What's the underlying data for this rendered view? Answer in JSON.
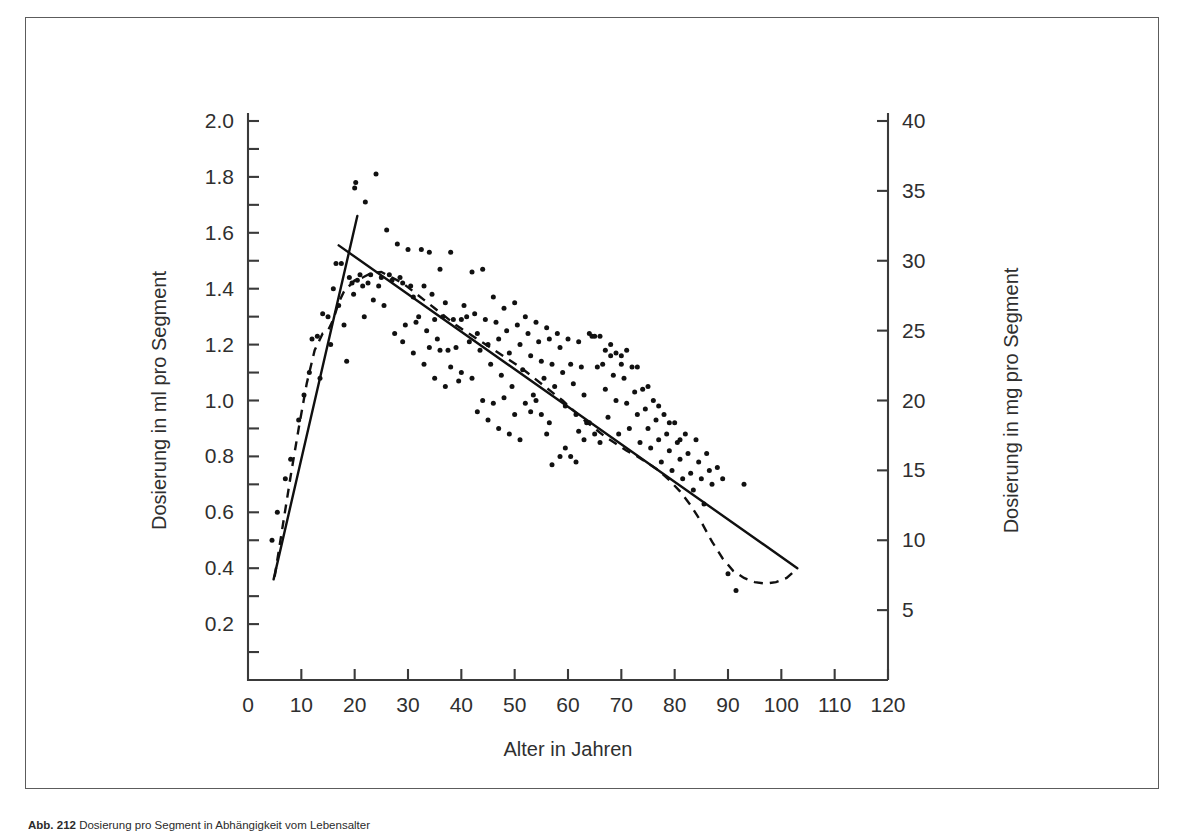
{
  "figure": {
    "caption_label": "Abb. 212",
    "caption_text": "Dosierung pro Segment in Abhängigkeit vom Lebensalter"
  },
  "chart_data": {
    "type": "scatter",
    "title": "",
    "xlabel": "Alter in Jahren",
    "ylabel": "Dosierung in ml pro Segment",
    "ylabel_right": "Dosierung in mg pro Segment",
    "xlim": [
      0,
      120
    ],
    "ylim": [
      0,
      2.0
    ],
    "ylim_right": [
      0,
      40
    ],
    "grid": false,
    "legend": "none",
    "xticks": [
      0,
      10,
      20,
      30,
      40,
      50,
      60,
      70,
      80,
      90,
      100,
      110,
      120
    ],
    "xtick_labels": [
      "0",
      "10",
      "20",
      "30",
      "40",
      "50",
      "60",
      "70",
      "80",
      "90",
      "100",
      "110",
      "120"
    ],
    "yticks": [
      0.2,
      0.4,
      0.6,
      0.8,
      1.0,
      1.2,
      1.4,
      1.6,
      1.8,
      2.0
    ],
    "ytick_labels": [
      "0.2",
      "0.4",
      "0.6",
      "0.8",
      "1.0",
      "1.2",
      "1.4",
      "1.6",
      "1.8",
      "2.0"
    ],
    "yticks_minor": [
      0.1,
      0.3,
      0.5,
      0.7,
      0.9,
      1.1,
      1.3,
      1.5,
      1.7,
      1.9
    ],
    "yticks_right": [
      5,
      10,
      15,
      20,
      25,
      30,
      35,
      40
    ],
    "ytick_labels_right": [
      "5",
      "10",
      "15",
      "20",
      "25",
      "30",
      "35",
      "40"
    ],
    "axis_color": "#3a3a3a",
    "point_color": "#111111",
    "line_color": "#101010",
    "series": [
      {
        "name": "Messpunkte",
        "marker": "dot",
        "points": [
          [
            4.5,
            0.5
          ],
          [
            5.5,
            0.6
          ],
          [
            7.0,
            0.72
          ],
          [
            8.0,
            0.79
          ],
          [
            9.5,
            0.93
          ],
          [
            10.5,
            1.02
          ],
          [
            11.5,
            1.1
          ],
          [
            12.0,
            1.22
          ],
          [
            13.0,
            1.23
          ],
          [
            13.5,
            1.08
          ],
          [
            14.0,
            1.31
          ],
          [
            15.0,
            1.3
          ],
          [
            15.5,
            1.2
          ],
          [
            16.0,
            1.4
          ],
          [
            16.5,
            1.49
          ],
          [
            17.0,
            1.34
          ],
          [
            17.5,
            1.49
          ],
          [
            18.0,
            1.27
          ],
          [
            18.5,
            1.14
          ],
          [
            19.0,
            1.44
          ],
          [
            19.5,
            1.42
          ],
          [
            19.8,
            1.38
          ],
          [
            20.0,
            1.76
          ],
          [
            20.2,
            1.78
          ],
          [
            20.5,
            1.43
          ],
          [
            21.0,
            1.45
          ],
          [
            21.5,
            1.41
          ],
          [
            21.8,
            1.3
          ],
          [
            22.0,
            1.71
          ],
          [
            22.5,
            1.42
          ],
          [
            23.0,
            1.45
          ],
          [
            23.5,
            1.36
          ],
          [
            24.0,
            1.81
          ],
          [
            24.5,
            1.41
          ],
          [
            25.0,
            1.44
          ],
          [
            25.5,
            1.34
          ],
          [
            26.0,
            1.61
          ],
          [
            26.5,
            1.45
          ],
          [
            27.0,
            1.43
          ],
          [
            27.5,
            1.24
          ],
          [
            28.0,
            1.56
          ],
          [
            28.5,
            1.44
          ],
          [
            29.0,
            1.42
          ],
          [
            29.5,
            1.27
          ],
          [
            30.0,
            1.54
          ],
          [
            30.5,
            1.41
          ],
          [
            31.0,
            1.37
          ],
          [
            31.5,
            1.28
          ],
          [
            32.0,
            1.3
          ],
          [
            32.5,
            1.54
          ],
          [
            33.0,
            1.41
          ],
          [
            33.5,
            1.25
          ],
          [
            34.0,
            1.53
          ],
          [
            34.5,
            1.38
          ],
          [
            35.0,
            1.29
          ],
          [
            35.5,
            1.22
          ],
          [
            36.0,
            1.47
          ],
          [
            36.5,
            1.3
          ],
          [
            37.0,
            1.35
          ],
          [
            37.5,
            1.18
          ],
          [
            38.0,
            1.53
          ],
          [
            38.5,
            1.29
          ],
          [
            39.0,
            1.19
          ],
          [
            39.5,
            1.07
          ],
          [
            40.0,
            1.29
          ],
          [
            40.5,
            1.34
          ],
          [
            41.0,
            1.3
          ],
          [
            41.5,
            1.21
          ],
          [
            42.0,
            1.46
          ],
          [
            42.5,
            1.31
          ],
          [
            43.0,
            1.24
          ],
          [
            43.5,
            1.18
          ],
          [
            44.0,
            1.47
          ],
          [
            44.5,
            1.29
          ],
          [
            45.0,
            1.2
          ],
          [
            45.5,
            1.13
          ],
          [
            46.0,
            1.37
          ],
          [
            46.5,
            1.28
          ],
          [
            47.0,
            1.22
          ],
          [
            47.5,
            1.09
          ],
          [
            48.0,
            1.33
          ],
          [
            48.5,
            1.25
          ],
          [
            49.0,
            1.17
          ],
          [
            49.5,
            1.05
          ],
          [
            50.0,
            1.35
          ],
          [
            50.5,
            1.27
          ],
          [
            51.0,
            1.2
          ],
          [
            51.5,
            1.11
          ],
          [
            52.0,
            1.3
          ],
          [
            52.5,
            1.24
          ],
          [
            53.0,
            1.16
          ],
          [
            53.5,
            1.02
          ],
          [
            54.0,
            1.28
          ],
          [
            54.5,
            1.21
          ],
          [
            55.0,
            1.14
          ],
          [
            55.5,
            1.08
          ],
          [
            56.0,
            1.26
          ],
          [
            56.5,
            1.22
          ],
          [
            57.0,
            1.13
          ],
          [
            57.5,
            1.05
          ],
          [
            58.0,
            1.24
          ],
          [
            58.5,
            1.19
          ],
          [
            59.0,
            1.1
          ],
          [
            59.5,
            0.98
          ],
          [
            60.0,
            1.22
          ],
          [
            60.5,
            1.13
          ],
          [
            61.0,
            1.06
          ],
          [
            61.5,
            0.95
          ],
          [
            62.0,
            1.21
          ],
          [
            62.5,
            1.12
          ],
          [
            63.0,
            1.02
          ],
          [
            63.5,
            0.92
          ],
          [
            64.0,
            1.24
          ],
          [
            64.5,
            1.23
          ],
          [
            65.0,
            1.23
          ],
          [
            65.5,
            1.12
          ],
          [
            66.0,
            1.23
          ],
          [
            66.5,
            1.13
          ],
          [
            67.0,
            1.04
          ],
          [
            67.5,
            0.94
          ],
          [
            68.0,
            1.16
          ],
          [
            68.5,
            1.09
          ],
          [
            69.0,
            1.0
          ],
          [
            69.5,
            0.88
          ],
          [
            70.0,
            1.13
          ],
          [
            70.5,
            1.08
          ],
          [
            71.0,
            0.99
          ],
          [
            71.5,
            0.9
          ],
          [
            72.0,
            1.12
          ],
          [
            72.5,
            1.03
          ],
          [
            73.0,
            0.95
          ],
          [
            73.5,
            0.85
          ],
          [
            74.0,
            1.04
          ],
          [
            74.5,
            0.97
          ],
          [
            75.0,
            0.9
          ],
          [
            75.5,
            0.83
          ],
          [
            76.0,
            1.0
          ],
          [
            76.5,
            0.93
          ],
          [
            77.0,
            0.86
          ],
          [
            77.5,
            0.78
          ],
          [
            78.0,
            0.95
          ],
          [
            78.5,
            0.88
          ],
          [
            79.0,
            0.82
          ],
          [
            79.5,
            0.75
          ],
          [
            80.0,
            0.92
          ],
          [
            80.5,
            0.85
          ],
          [
            81.0,
            0.79
          ],
          [
            81.5,
            0.72
          ],
          [
            82.0,
            0.88
          ],
          [
            82.5,
            0.81
          ],
          [
            83.0,
            0.74
          ],
          [
            83.5,
            0.68
          ],
          [
            84.0,
            0.86
          ],
          [
            84.5,
            0.78
          ],
          [
            85.0,
            0.72
          ],
          [
            85.5,
            0.63
          ],
          [
            86.0,
            0.81
          ],
          [
            86.5,
            0.75
          ],
          [
            87.0,
            0.7
          ],
          [
            88.0,
            0.76
          ],
          [
            89.0,
            0.72
          ],
          [
            90.0,
            0.38
          ],
          [
            91.5,
            0.32
          ],
          [
            93.0,
            0.7
          ],
          [
            57.0,
            0.77
          ],
          [
            58.5,
            0.8
          ],
          [
            59.5,
            0.83
          ],
          [
            60.5,
            0.8
          ],
          [
            61.5,
            0.78
          ],
          [
            56.0,
            0.88
          ],
          [
            56.5,
            0.92
          ],
          [
            55.0,
            0.95
          ],
          [
            54.0,
            1.0
          ],
          [
            53.0,
            0.96
          ],
          [
            62.0,
            0.89
          ],
          [
            63.0,
            0.86
          ],
          [
            64.0,
            0.92
          ],
          [
            65.0,
            0.88
          ],
          [
            66.0,
            0.85
          ],
          [
            44.0,
            1.0
          ],
          [
            46.0,
            0.99
          ],
          [
            48.0,
            1.01
          ],
          [
            50.0,
            0.95
          ],
          [
            52.0,
            0.99
          ],
          [
            36.0,
            1.18
          ],
          [
            34.0,
            1.19
          ],
          [
            38.0,
            1.12
          ],
          [
            40.0,
            1.1
          ],
          [
            42.0,
            1.08
          ],
          [
            67.0,
            1.18
          ],
          [
            68.0,
            1.2
          ],
          [
            69.0,
            1.17
          ],
          [
            70.0,
            1.16
          ],
          [
            71.0,
            1.18
          ],
          [
            73.0,
            1.12
          ],
          [
            75.0,
            1.05
          ],
          [
            77.0,
            0.98
          ],
          [
            79.0,
            0.92
          ],
          [
            81.0,
            0.86
          ],
          [
            29.0,
            1.21
          ],
          [
            31.0,
            1.17
          ],
          [
            33.0,
            1.13
          ],
          [
            35.0,
            1.08
          ],
          [
            37.0,
            1.05
          ],
          [
            45.0,
            0.93
          ],
          [
            47.0,
            0.9
          ],
          [
            49.0,
            0.88
          ],
          [
            51.0,
            0.86
          ],
          [
            43.0,
            0.96
          ]
        ]
      }
    ],
    "fit_lines": [
      {
        "name": "ascending-regression",
        "style": "solid",
        "x": [
          4.8,
          20.5
        ],
        "y": [
          0.36,
          1.66
        ]
      },
      {
        "name": "descending-regression",
        "style": "solid",
        "x": [
          17.0,
          103.0
        ],
        "y": [
          1.555,
          0.4
        ]
      }
    ],
    "smooth_curve": {
      "name": "lowess-smooth",
      "style": "dashed",
      "points": [
        [
          5.0,
          0.37
        ],
        [
          6.5,
          0.55
        ],
        [
          8.0,
          0.73
        ],
        [
          9.5,
          0.9
        ],
        [
          11.0,
          1.06
        ],
        [
          12.5,
          1.18
        ],
        [
          14.0,
          1.24
        ],
        [
          15.0,
          1.25
        ],
        [
          16.0,
          1.29
        ],
        [
          17.0,
          1.35
        ],
        [
          18.0,
          1.39
        ],
        [
          19.0,
          1.41
        ],
        [
          20.0,
          1.43
        ],
        [
          21.5,
          1.44
        ],
        [
          23.0,
          1.455
        ],
        [
          25.0,
          1.46
        ],
        [
          27.0,
          1.44
        ],
        [
          29.0,
          1.42
        ],
        [
          31.0,
          1.39
        ],
        [
          33.0,
          1.36
        ],
        [
          35.0,
          1.33
        ],
        [
          37.0,
          1.3
        ],
        [
          39.0,
          1.27
        ],
        [
          41.0,
          1.245
        ],
        [
          43.0,
          1.22
        ],
        [
          45.0,
          1.195
        ],
        [
          47.0,
          1.17
        ],
        [
          49.0,
          1.145
        ],
        [
          51.0,
          1.12
        ],
        [
          53.0,
          1.09
        ],
        [
          55.0,
          1.06
        ],
        [
          57.0,
          1.03
        ],
        [
          59.0,
          1.0
        ],
        [
          61.0,
          0.965
        ],
        [
          63.0,
          0.93
        ],
        [
          65.0,
          0.9
        ],
        [
          67.0,
          0.87
        ],
        [
          69.0,
          0.845
        ],
        [
          71.0,
          0.82
        ],
        [
          73.0,
          0.8
        ],
        [
          75.0,
          0.775
        ],
        [
          77.0,
          0.75
        ],
        [
          79.0,
          0.715
        ],
        [
          81.0,
          0.675
        ],
        [
          83.0,
          0.625
        ],
        [
          85.0,
          0.565
        ],
        [
          87.0,
          0.495
        ],
        [
          89.0,
          0.435
        ],
        [
          91.0,
          0.39
        ],
        [
          93.0,
          0.365
        ],
        [
          95.0,
          0.35
        ],
        [
          97.0,
          0.345
        ],
        [
          99.0,
          0.35
        ],
        [
          101.0,
          0.365
        ],
        [
          102.5,
          0.39
        ]
      ]
    }
  }
}
